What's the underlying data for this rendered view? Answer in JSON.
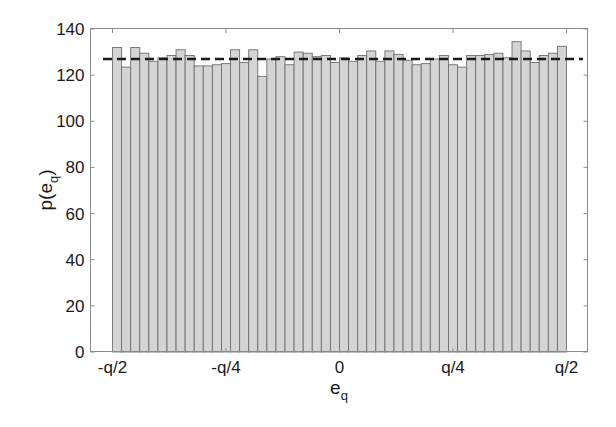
{
  "chart_data": {
    "type": "bar",
    "subtype": "histogram",
    "title": "",
    "xlabel": "e",
    "xlabel_subscript": "q",
    "ylabel": "p(e",
    "ylabel_subscript": "q",
    "ylabel_suffix": ")",
    "ylim": [
      0,
      140
    ],
    "xlim_labels": [
      "-q/2",
      "q/2"
    ],
    "yticks": [
      0,
      20,
      40,
      60,
      80,
      100,
      120,
      140
    ],
    "xticks": [
      {
        "pos": 0.0,
        "label": "-q/2"
      },
      {
        "pos": 0.25,
        "label": "-q/4"
      },
      {
        "pos": 0.5,
        "label": "0"
      },
      {
        "pos": 0.75,
        "label": "q/4"
      },
      {
        "pos": 1.0,
        "label": "q/2"
      }
    ],
    "bin_count": 50,
    "values": [
      132,
      123.5,
      132,
      129.5,
      126,
      127.5,
      128.5,
      131,
      128.5,
      124,
      124,
      124.5,
      125,
      131,
      125.5,
      131,
      119.5,
      127,
      128,
      124.5,
      130,
      129.5,
      128,
      128.5,
      125.5,
      127.5,
      126,
      128.5,
      130.5,
      126,
      130.5,
      129,
      126.5,
      124.5,
      125,
      127,
      128.5,
      124.5,
      123.5,
      128.5,
      128.5,
      129,
      129.5,
      127.5,
      134.5,
      130.5,
      125.5,
      128.5,
      129.5,
      132.5
    ],
    "reference_line": {
      "value": 127,
      "style": "dashed",
      "color": "#1a1a1a",
      "label": "uniform density"
    },
    "bar_color": "#d4d4d4",
    "bar_edge_color": "#6f6f6f",
    "grid": false,
    "legend": null
  }
}
